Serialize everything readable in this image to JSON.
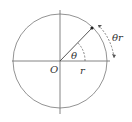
{
  "diagram": {
    "type": "unit-circle-arc-length",
    "labels": {
      "origin": "O",
      "angle": "θ",
      "radius": "r",
      "arc": "θr"
    },
    "colors": {
      "stroke": "#555555",
      "background": "#ffffff"
    }
  }
}
